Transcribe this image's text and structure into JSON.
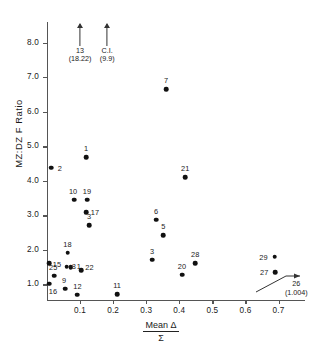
{
  "chart_data": {
    "type": "scatter",
    "title": "",
    "xlabel_numerator": "Mean Δ",
    "xlabel_denominator": "Σ",
    "ylabel": "MZ:DZ  F  Ratio",
    "xlim": [
      0.0,
      0.78
    ],
    "ylim": [
      0.55,
      8.6
    ],
    "xticks": [
      "0.1",
      "0.2",
      "0.3",
      "0.4",
      "0.5",
      "0.6",
      "0.7"
    ],
    "xtick_values": [
      0.1,
      0.2,
      0.3,
      0.4,
      0.5,
      0.6,
      0.7
    ],
    "yticks": [
      "1.0",
      "2.0",
      "3.0",
      "4.0",
      "5.0",
      "6.0",
      "7.0",
      "8.0"
    ],
    "ytick_values": [
      1.0,
      2.0,
      3.0,
      4.0,
      5.0,
      6.0,
      7.0,
      8.0
    ],
    "grid": false,
    "legend": "none",
    "points": [
      {
        "label": "2",
        "x": 0.012,
        "y": 4.38,
        "lx": 9,
        "ly": 0
      },
      {
        "label": "1",
        "x": 0.118,
        "y": 4.68,
        "lx": 0,
        "ly": -9
      },
      {
        "label": "10",
        "x": 0.082,
        "y": 3.45,
        "lx": -1,
        "ly": -9
      },
      {
        "label": "19",
        "x": 0.121,
        "y": 3.45,
        "lx": 0,
        "ly": -9
      },
      {
        "label": "17",
        "x": 0.118,
        "y": 3.1,
        "lx": 9,
        "ly": 0
      },
      {
        "label": "3",
        "x": 0.127,
        "y": 2.72,
        "lx": 0,
        "ly": -9
      },
      {
        "label": "7",
        "x": 0.36,
        "y": 6.65,
        "lx": 0,
        "ly": -9
      },
      {
        "label": "21",
        "x": 0.418,
        "y": 4.1,
        "lx": 0,
        "ly": -9
      },
      {
        "label": "6",
        "x": 0.33,
        "y": 2.88,
        "lx": 0,
        "ly": -9
      },
      {
        "label": "5",
        "x": 0.352,
        "y": 2.42,
        "lx": 0,
        "ly": -9
      },
      {
        "label": "3",
        "x": 0.318,
        "y": 1.72,
        "lx": 0,
        "ly": -9
      },
      {
        "label": "28",
        "x": 0.448,
        "y": 1.62,
        "lx": 0,
        "ly": -9
      },
      {
        "label": "20",
        "x": 0.408,
        "y": 1.28,
        "lx": 0,
        "ly": -9
      },
      {
        "label": "29",
        "x": 0.688,
        "y": 1.8,
        "lx": -11,
        "ly": 0
      },
      {
        "label": "27",
        "x": 0.69,
        "y": 1.35,
        "lx": -11,
        "ly": 0
      },
      {
        "label": "18",
        "x": 0.062,
        "y": 1.92,
        "lx": 0,
        "ly": -9
      },
      {
        "label": "15",
        "x": 0.006,
        "y": 1.62,
        "lx": 8,
        "ly": 1
      },
      {
        "label": "8",
        "x": 0.06,
        "y": 1.52,
        "lx": 7,
        "ly": -1
      },
      {
        "label": "1",
        "x": 0.072,
        "y": 1.5,
        "lx": 8,
        "ly": -1
      },
      {
        "label": "22",
        "x": 0.104,
        "y": 1.42,
        "lx": 8,
        "ly": -3
      },
      {
        "label": "25",
        "x": 0.022,
        "y": 1.25,
        "lx": -1,
        "ly": -9
      },
      {
        "label": "16",
        "x": 0.006,
        "y": 1.02,
        "lx": 4,
        "ly": 7
      },
      {
        "label": "9",
        "x": 0.055,
        "y": 0.88,
        "lx": -1,
        "ly": -9
      },
      {
        "label": "12",
        "x": 0.092,
        "y": 0.7,
        "lx": 0,
        "ly": -9
      },
      {
        "label": "11",
        "x": 0.212,
        "y": 0.72,
        "lx": 0,
        "ly": -9
      }
    ],
    "annotations": [
      {
        "name": "arrow-13",
        "x": 0.1,
        "top_y": 8.55,
        "line1": "13",
        "line2": "(18.22)"
      },
      {
        "name": "arrow-ci",
        "x": 0.182,
        "top_y": 8.55,
        "line1": "C.I.",
        "line2": "(9.9)"
      },
      {
        "name": "callout-26",
        "line1": "26",
        "line2": "(1.004)",
        "target_x": 0.77,
        "target_y": 1.06
      }
    ]
  },
  "colors": {
    "point": "#111111",
    "axis": "#555555",
    "text": "#1a1a1a",
    "background": "#ffffff"
  }
}
